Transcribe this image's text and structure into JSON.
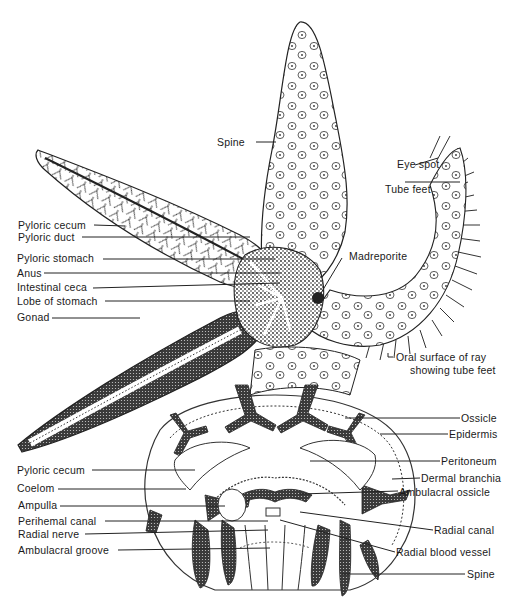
{
  "diagram": {
    "colors": {
      "ink": "#1a1a1a",
      "stipple": "#3a3a3a",
      "background": "#ffffff"
    },
    "labels": {
      "spine_top": "Spine",
      "eye_spot": "Eye spot",
      "tube_feet": "Tube feet",
      "pyloric_cecum_top": "Pyloric cecum",
      "madreporite": "Madreporite",
      "pyloric_duct": "Pyloric duct",
      "pyloric_stomach": "Pyloric stomach",
      "anus": "Anus",
      "intestinal_ceca": "Intestinal ceca",
      "lobe_of_stomach": "Lobe of stomach",
      "gonad": "Gonad",
      "oral_surface_line1": "Oral surface of ray",
      "oral_surface_line2": "showing tube feet",
      "ossicle": "Ossicle",
      "epidermis": "Epidermis",
      "pyloric_cecum_bottom": "Pyloric cecum",
      "peritoneum": "Peritoneum",
      "coelom": "Coelom",
      "dermal_branchia": "Dermal branchia",
      "ampulla": "Ampulla",
      "ambulacral_ossicle": "Ambulacral ossicle",
      "perihemal_canal": "Perihemal canal",
      "radial_canal": "Radial canal",
      "radial_nerve": "Radial nerve",
      "radial_blood_vessel": "Radial blood vessel",
      "ambulacral_groove": "Ambulacral groove",
      "spine_bottom": "Spine"
    }
  }
}
